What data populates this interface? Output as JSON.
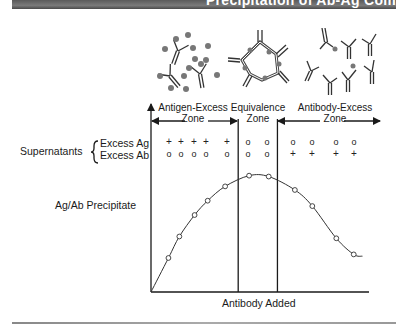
{
  "title": "Precipitation of Ab-Ag Com",
  "zones": [
    {
      "line1": "Antigen-Excess",
      "line2": "Zone"
    },
    {
      "line1": "Equivalence",
      "line2": "Zone"
    },
    {
      "line1": "Antibody-Excess",
      "line2": "Zone"
    }
  ],
  "row_labels": {
    "supernatants": "Supernatants",
    "excess_ag": "Excess Ag",
    "excess_ab": "Excess Ab",
    "precipitate": "Ag/Ab Precipitate"
  },
  "xlabel": "Antibody Added",
  "supernatant_symbols": {
    "excess_ag_row": [
      "+",
      "+",
      "+",
      "+",
      "+",
      "o",
      "o",
      "o",
      "o",
      "o",
      "o"
    ],
    "excess_ab_row": [
      "o",
      "o",
      "o",
      "o",
      "o",
      "o",
      "o",
      "+",
      "+",
      "+",
      "+"
    ]
  },
  "molecule_icons": [
    "antigen-excess-complexes-icon",
    "lattice-complex-icon",
    "antibody-excess-complexes-icon"
  ],
  "chart_data": {
    "type": "line",
    "title": "",
    "xlabel": "Antibody Added",
    "ylabel": "Ag/Ab Precipitate",
    "x": [
      0,
      0.08,
      0.13,
      0.2,
      0.26,
      0.34,
      0.45,
      0.54,
      0.66,
      0.74,
      0.85,
      0.93,
      0.97
    ],
    "series": [
      {
        "name": "Ag/Ab Precipitate",
        "values": [
          0,
          0.19,
          0.31,
          0.43,
          0.51,
          0.59,
          0.65,
          0.645,
          0.57,
          0.48,
          0.3,
          0.21,
          0.2
        ],
        "markers": [
          false,
          true,
          true,
          true,
          true,
          true,
          true,
          true,
          true,
          true,
          true,
          true,
          false
        ]
      }
    ],
    "zone_boundaries_x": [
      0.4,
      0.58
    ],
    "xlim": [
      0,
      1
    ],
    "ylim": [
      0,
      1
    ],
    "grid": false
  }
}
